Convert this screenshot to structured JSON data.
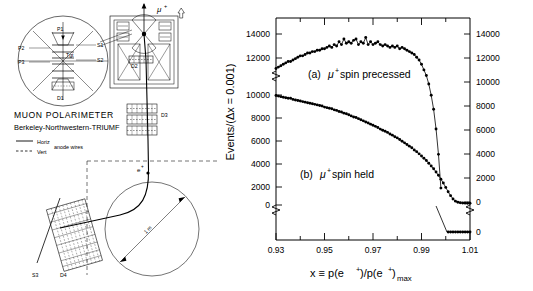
{
  "figure": {
    "panels": [
      "apparatus-diagram",
      "spectrum-chart"
    ]
  },
  "diagram": {
    "title_line1": "MUON POLARIMETER",
    "title_line2": "Berkeley-Northwestern-TRIUMF",
    "legend": [
      {
        "style": "solid",
        "label": "Horiz"
      },
      {
        "style": "dashed",
        "label": "Vert"
      }
    ],
    "legend_note": "anode wires",
    "beam_label": "μ",
    "beam_label_sup": "+",
    "positron_label": "e",
    "positron_label_sup": "+",
    "radius_label": "1 m",
    "components": [
      {
        "name": "P1",
        "label": "P1"
      },
      {
        "name": "P2",
        "label": "P2"
      },
      {
        "name": "P3",
        "label": "P3"
      },
      {
        "name": "S1",
        "label": "S1"
      },
      {
        "name": "S2",
        "label": "S2"
      },
      {
        "name": "Tgt",
        "label": "Tgt"
      },
      {
        "name": "D1",
        "label": "D1"
      },
      {
        "name": "D2",
        "label": "D2"
      },
      {
        "name": "D3",
        "label": "D3"
      },
      {
        "name": "D4",
        "label": "D4"
      },
      {
        "name": "S3",
        "label": "S3"
      }
    ]
  },
  "chart_data": {
    "type": "scatter",
    "title": "",
    "xlabel": "x ≡ p(e⁺)/p(e⁺)max",
    "xlabel_parts": {
      "lead": "x ≡ p(e",
      "sup1": "+",
      "mid": ")/p(e",
      "sup2": "+",
      "tail": ")",
      "sub": "max"
    },
    "ylabel": "Events/(Δx = 0.001)",
    "xlim": [
      0.93,
      1.01
    ],
    "xticks": [
      0.93,
      0.95,
      0.97,
      0.99,
      1.01
    ],
    "xticklabels": [
      "0.93",
      "0.95",
      "0.97",
      "0.99",
      "1.01"
    ],
    "x_minor_ticks": [
      0.94,
      0.96,
      0.98,
      1.0
    ],
    "grid": false,
    "legend_position": "inline-annotations",
    "axis_break": true,
    "upper_panel": {
      "ylim": [
        8000,
        15000
      ],
      "yticks": [
        14000,
        12000,
        10000,
        8000
      ],
      "yticklabels": [
        "14000",
        "12000",
        "10000",
        "8000"
      ],
      "right_yticks": [
        14000,
        12000,
        10000,
        8000,
        6000,
        4000,
        2000,
        0
      ],
      "right_yticklabels": [
        "14000",
        "12000",
        "10000",
        "8000",
        "6000",
        "4000",
        "2000",
        "0"
      ]
    },
    "lower_panel": {
      "yticks": [
        10000,
        8000,
        6000,
        4000,
        2000,
        0
      ],
      "yticklabels": [
        "10000",
        "8000",
        "6000",
        "4000",
        "2000",
        "0"
      ],
      "right_yticklabels": [
        "0"
      ]
    },
    "annotations": [
      {
        "name": "curve-a-label",
        "text_lead": "(a) ",
        "mu": "μ",
        "sup": "+",
        "text_tail": " spin precessed",
        "x": 0.962,
        "y": 11400
      },
      {
        "name": "curve-b-label",
        "text_lead": "(b) ",
        "mu": "μ",
        "sup": "+",
        "text_tail": " spin held",
        "x": 0.952,
        "y": 2700
      }
    ],
    "series": [
      {
        "name": "(a) mu+ spin precessed",
        "marker": "filled-circle",
        "color": "#000000",
        "x": [
          0.93,
          0.931,
          0.932,
          0.933,
          0.934,
          0.935,
          0.936,
          0.937,
          0.938,
          0.939,
          0.94,
          0.941,
          0.942,
          0.943,
          0.944,
          0.945,
          0.946,
          0.947,
          0.948,
          0.949,
          0.95,
          0.951,
          0.952,
          0.953,
          0.954,
          0.955,
          0.956,
          0.957,
          0.958,
          0.959,
          0.96,
          0.961,
          0.962,
          0.963,
          0.964,
          0.965,
          0.966,
          0.967,
          0.968,
          0.969,
          0.97,
          0.971,
          0.972,
          0.973,
          0.974,
          0.975,
          0.976,
          0.977,
          0.978,
          0.979,
          0.98,
          0.981,
          0.982,
          0.983,
          0.984,
          0.985,
          0.986,
          0.987,
          0.988,
          0.989,
          0.99,
          0.991,
          0.992,
          0.993,
          0.994,
          0.995,
          0.996,
          0.997,
          0.998,
          0.999,
          1.0,
          1.001,
          1.002,
          1.003,
          1.004,
          1.005,
          1.006,
          1.007,
          1.008,
          1.009,
          1.01
        ],
        "y": [
          12850,
          12900,
          12950,
          13000,
          13050,
          13100,
          13100,
          13150,
          13200,
          13250,
          13300,
          13300,
          13350,
          13400,
          13400,
          13450,
          13450,
          13500,
          13500,
          13550,
          13550,
          13600,
          13650,
          13600,
          13700,
          13650,
          13800,
          13700,
          13900,
          13750,
          13800,
          13750,
          13850,
          13900,
          13700,
          13800,
          13750,
          13950,
          13700,
          13800,
          13700,
          13750,
          13800,
          13700,
          13650,
          13700,
          13650,
          13600,
          13650,
          13600,
          13650,
          13550,
          13600,
          13550,
          13500,
          13450,
          13400,
          13350,
          13250,
          13150,
          13000,
          12800,
          12600,
          12300,
          11900,
          11400,
          10700,
          9800,
          8600,
          7200,
          5600,
          3900,
          2400,
          1400,
          800,
          500,
          350,
          300,
          280,
          270,
          270
        ]
      },
      {
        "name": "(b) mu+ spin held",
        "marker": "filled-circle",
        "color": "#000000",
        "x": [
          0.93,
          0.931,
          0.932,
          0.933,
          0.934,
          0.935,
          0.936,
          0.937,
          0.938,
          0.939,
          0.94,
          0.941,
          0.942,
          0.943,
          0.944,
          0.945,
          0.946,
          0.947,
          0.948,
          0.949,
          0.95,
          0.951,
          0.952,
          0.953,
          0.954,
          0.955,
          0.956,
          0.957,
          0.958,
          0.959,
          0.96,
          0.961,
          0.962,
          0.963,
          0.964,
          0.965,
          0.966,
          0.967,
          0.968,
          0.969,
          0.97,
          0.971,
          0.972,
          0.973,
          0.974,
          0.975,
          0.976,
          0.977,
          0.978,
          0.979,
          0.98,
          0.981,
          0.982,
          0.983,
          0.984,
          0.985,
          0.986,
          0.987,
          0.988,
          0.989,
          0.99,
          0.991,
          0.992,
          0.993,
          0.994,
          0.995,
          0.996,
          0.997,
          0.998,
          0.999,
          1.0,
          1.001,
          1.002,
          1.003,
          1.004,
          1.005,
          1.006,
          1.007,
          1.008,
          1.009,
          1.01
        ],
        "y": [
          9950,
          9900,
          9850,
          9800,
          9750,
          9700,
          9700,
          9600,
          9550,
          9500,
          9450,
          9400,
          9350,
          9300,
          9250,
          9200,
          9150,
          9100,
          9050,
          9000,
          8900,
          8850,
          8800,
          8750,
          8650,
          8600,
          8500,
          8450,
          8350,
          8300,
          8200,
          8100,
          8000,
          7950,
          7850,
          7750,
          7650,
          7550,
          7450,
          7350,
          7250,
          7150,
          7050,
          6900,
          6800,
          6700,
          6600,
          6450,
          6350,
          6200,
          6100,
          5950,
          5800,
          5650,
          5500,
          5350,
          5200,
          5000,
          4850,
          4650,
          4450,
          4250,
          4050,
          3800,
          3550,
          3300,
          3000,
          2700,
          2350,
          2000,
          1600,
          1200,
          850,
          550,
          350,
          250,
          200,
          180,
          170,
          165,
          165
        ]
      }
    ]
  }
}
